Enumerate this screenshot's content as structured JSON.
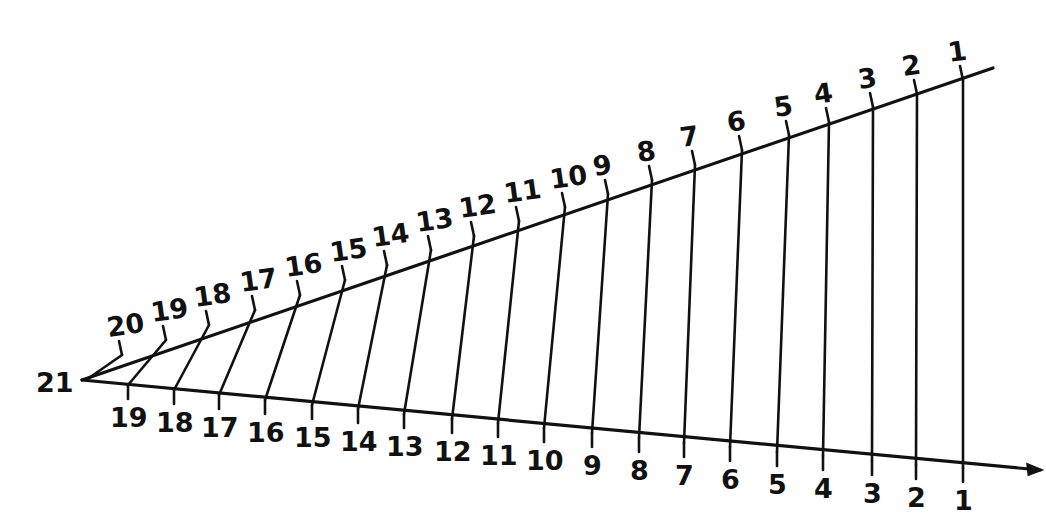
{
  "colors": {
    "ink": "#111111",
    "background": "#ffffff"
  },
  "vertex": {
    "label": "21",
    "x": 82,
    "y": 380
  },
  "upper_line": {
    "end": {
      "x": 993,
      "y": 68
    },
    "ticks": [
      {
        "label": "1",
        "x": 963,
        "y": 80
      },
      {
        "label": "2",
        "x": 917,
        "y": 94
      },
      {
        "label": "3",
        "x": 873,
        "y": 107
      },
      {
        "label": "4",
        "x": 829,
        "y": 122
      },
      {
        "label": "5",
        "x": 789,
        "y": 135
      },
      {
        "label": "6",
        "x": 742,
        "y": 150
      },
      {
        "label": "7",
        "x": 695,
        "y": 165
      },
      {
        "label": "8",
        "x": 652,
        "y": 180
      },
      {
        "label": "9",
        "x": 608,
        "y": 194
      },
      {
        "label": "10",
        "x": 565,
        "y": 207
      },
      {
        "label": "11",
        "x": 519,
        "y": 221
      },
      {
        "label": "12",
        "x": 474,
        "y": 236
      },
      {
        "label": "13",
        "x": 431,
        "y": 250
      },
      {
        "label": "14",
        "x": 387,
        "y": 265
      },
      {
        "label": "15",
        "x": 345,
        "y": 280
      },
      {
        "label": "16",
        "x": 300,
        "y": 295
      },
      {
        "label": "17",
        "x": 255,
        "y": 310
      },
      {
        "label": "18",
        "x": 209,
        "y": 325
      },
      {
        "label": "19",
        "x": 166,
        "y": 340
      },
      {
        "label": "20",
        "x": 122,
        "y": 355
      }
    ]
  },
  "lower_line": {
    "end": {
      "x": 1040,
      "y": 470
    },
    "ticks": [
      {
        "label": "1",
        "x": 963,
        "y": 468
      },
      {
        "label": "2",
        "x": 916,
        "y": 465
      },
      {
        "label": "3",
        "x": 872,
        "y": 461
      },
      {
        "label": "4",
        "x": 823,
        "y": 456
      },
      {
        "label": "5",
        "x": 777,
        "y": 452
      },
      {
        "label": "6",
        "x": 730,
        "y": 447
      },
      {
        "label": "7",
        "x": 684,
        "y": 443
      },
      {
        "label": "8",
        "x": 639,
        "y": 438
      },
      {
        "label": "9",
        "x": 592,
        "y": 433
      },
      {
        "label": "10",
        "x": 544,
        "y": 428
      },
      {
        "label": "11",
        "x": 498,
        "y": 423
      },
      {
        "label": "12",
        "x": 452,
        "y": 419
      },
      {
        "label": "13",
        "x": 404,
        "y": 414
      },
      {
        "label": "14",
        "x": 358,
        "y": 409
      },
      {
        "label": "15",
        "x": 312,
        "y": 405
      },
      {
        "label": "16",
        "x": 265,
        "y": 400
      },
      {
        "label": "17",
        "x": 219,
        "y": 395
      },
      {
        "label": "18",
        "x": 174,
        "y": 390
      },
      {
        "label": "19",
        "x": 128,
        "y": 385
      }
    ]
  },
  "connections": "upper tick k joined to lower tick k for k = 1..19"
}
